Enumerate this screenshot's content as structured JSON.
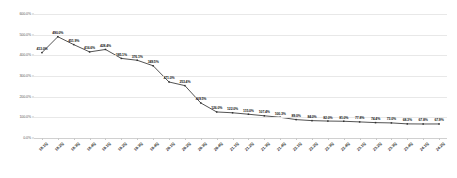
{
  "chart_data": {
    "type": "line",
    "title": "",
    "subtitle": "",
    "xlabel": "",
    "ylabel": "",
    "ylim": [
      0,
      600
    ],
    "y_tick_labels": [
      "600.0%",
      "500.0%",
      "400.0%",
      "300.0%",
      "200.0%",
      "100.0%",
      "0.0%"
    ],
    "y_ticks": [
      600,
      500,
      400,
      300,
      200,
      100,
      0
    ],
    "grid": true,
    "legend": "none",
    "value_suffix": "%",
    "categories": [
      "18.1Q",
      "18.2Q",
      "18.3Q",
      "18.4Q",
      "19.1Q",
      "19.2Q",
      "19.3Q",
      "19.4Q",
      "20.1Q",
      "20.2Q",
      "20.3Q",
      "20.4Q",
      "21.1Q",
      "21.2Q",
      "21.3Q",
      "21.4Q",
      "22.1Q",
      "22.2Q",
      "22.3Q",
      "22.4Q",
      "23.1Q",
      "23.2Q",
      "23.3Q",
      "23.4Q",
      "24.1Q",
      "24.2Q"
    ],
    "values": [
      413.0,
      490.0,
      451.9,
      416.6,
      428.4,
      385.1,
      376.1,
      349.5,
      271.0,
      253.4,
      169.5,
      126.0,
      122.0,
      115.0,
      107.4,
      100.3,
      89.0,
      84.0,
      82.0,
      81.0,
      77.8,
      74.4,
      73.0,
      68.3,
      67.8,
      67.9
    ],
    "data_labels": [
      "413.0%",
      "490.0%",
      "451.9%",
      "416.6%",
      "428.4%",
      "385.1%",
      "376.1%",
      "349.5%",
      "271.0%",
      "253.4%",
      "169.5%",
      "126.0%",
      "122.0%",
      "115.0%",
      "107.4%",
      "100.3%",
      "89.0%",
      "84.0%",
      "82.0%",
      "81.0%",
      "77.8%",
      "74.4%",
      "73.0%",
      "68.3%",
      "67.8%",
      "67.9%"
    ],
    "line_color": "#404040",
    "marker_color": "#303030",
    "grid_color": "#e8e8e8",
    "background_color": "#ffffff"
  }
}
